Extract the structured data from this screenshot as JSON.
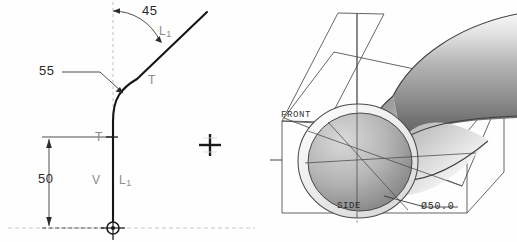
{
  "app": {
    "background_color": "#fefefe",
    "view_split": "two-pane"
  },
  "sketch_view": {
    "name": "2D sketch of pipe centerline with bend",
    "dimensions": [
      {
        "id": "angle",
        "value": "45",
        "kind": "angular-dimension",
        "unit_implied": "degrees"
      },
      {
        "id": "bend-radius",
        "value": "55",
        "kind": "linear-dimension"
      },
      {
        "id": "vertical-length",
        "value": "50",
        "kind": "linear-dimension"
      }
    ],
    "constraint_symbols": [
      {
        "id": "tangent-upper",
        "label": "T",
        "meaning": "tangent-constraint"
      },
      {
        "id": "tangent-lower",
        "label": "T",
        "meaning": "tangent-constraint"
      },
      {
        "id": "vertical",
        "label": "V",
        "meaning": "vertical-constraint"
      },
      {
        "id": "equal-length-upper",
        "label": "L",
        "subscript": "1",
        "meaning": "equal-length-constraint"
      },
      {
        "id": "equal-length-lower",
        "label": "L",
        "subscript": "1",
        "meaning": "equal-length-constraint"
      }
    ],
    "markers": [
      {
        "id": "origin",
        "shape": "circle-crosshair"
      },
      {
        "id": "reference-point",
        "shape": "plus-crosshair"
      }
    ],
    "colors": {
      "geometry": "#1a1a1a",
      "dimension": "#2b2b2b",
      "constraint": "#8a8a8a",
      "centerline": "#b9b9b9"
    }
  },
  "model_view": {
    "name": "3D shaded pipe elbow",
    "datum_planes": [
      {
        "id": "front-plane",
        "label": "FRONT"
      },
      {
        "id": "side-plane",
        "label": "SIDE"
      }
    ],
    "dimensions": [
      {
        "id": "bore-diameter",
        "value": "Ø50.0",
        "kind": "diameter-dimension"
      }
    ],
    "colors": {
      "shade_light": "#f2f2f2",
      "shade_mid": "#c6c6c6",
      "shade_dark": "#7e7e7e",
      "shade_deep": "#5b5b5b",
      "edge": "#3a3a3a",
      "plane_edge": "#4a4a4a"
    }
  }
}
